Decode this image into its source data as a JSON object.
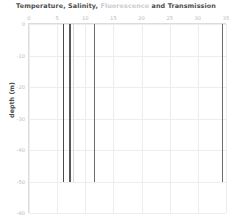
{
  "chart_data": {
    "type": "line",
    "title": "Temperature, Salinity, Fluorescence and Transmission",
    "title_parts": [
      {
        "text": "Temperature,",
        "color": "#4d4d4d"
      },
      {
        "text": "Salinity,",
        "color": "#4d4d4d"
      },
      {
        "text": "Fluorescence",
        "color": "#c9ccd1"
      },
      {
        "text": "and",
        "color": "#4d4d4d"
      },
      {
        "text": "Transmission",
        "color": "#4d4d4d"
      }
    ],
    "xlabel": "",
    "ylabel": "depth (m)",
    "xlim": [
      0,
      35
    ],
    "ylim": [
      -60,
      0
    ],
    "xticks": [
      0,
      5,
      10,
      15,
      20,
      25,
      30,
      35
    ],
    "xtick_labels": [
      "0",
      "5",
      "10",
      "15",
      "20",
      "25",
      "30",
      "35"
    ],
    "yticks": [
      0,
      -10,
      -20,
      -30,
      -40,
      -50,
      -60
    ],
    "ytick_labels": [
      "0",
      "-10",
      "-20",
      "-30",
      "-40",
      "-50",
      "-60"
    ],
    "x_axis_position": "top",
    "grid": true,
    "legend": "none",
    "series": [
      {
        "name": "Temperature",
        "color": "#4a4a4a",
        "x_mean": 6.1,
        "depth_start": 0,
        "depth_end": -50,
        "points": [
          {
            "depth": 0,
            "value": 6.2
          },
          {
            "depth": -10,
            "value": 6.1
          },
          {
            "depth": -20,
            "value": 6.1
          },
          {
            "depth": -30,
            "value": 6.0
          },
          {
            "depth": -40,
            "value": 6.0
          },
          {
            "depth": -50,
            "value": 6.0
          }
        ]
      },
      {
        "name": "Salinity",
        "color": "#5a5a5a",
        "x_mean": 7.3,
        "depth_start": 0,
        "depth_end": -50,
        "points": [
          {
            "depth": 0,
            "value": 7.3
          },
          {
            "depth": -10,
            "value": 7.3
          },
          {
            "depth": -20,
            "value": 7.3
          },
          {
            "depth": -30,
            "value": 7.3
          },
          {
            "depth": -40,
            "value": 7.3
          },
          {
            "depth": -50,
            "value": 7.3
          }
        ]
      },
      {
        "name": "Fluorescence",
        "color": "#d6d9dd",
        "x_mean": 7.9,
        "depth_start": 0,
        "depth_end": -50,
        "points": [
          {
            "depth": 0,
            "value": 7.9
          },
          {
            "depth": -10,
            "value": 7.9
          },
          {
            "depth": -20,
            "value": 7.9
          },
          {
            "depth": -30,
            "value": 7.9
          },
          {
            "depth": -40,
            "value": 7.9
          },
          {
            "depth": -50,
            "value": 7.9
          }
        ]
      },
      {
        "name": "Transmission-inner",
        "color": "#6b6b6b",
        "x_mean": 11.6,
        "depth_start": 0,
        "depth_end": -50,
        "points": [
          {
            "depth": 0,
            "value": 11.6
          },
          {
            "depth": -10,
            "value": 11.6
          },
          {
            "depth": -20,
            "value": 11.6
          },
          {
            "depth": -30,
            "value": 11.6
          },
          {
            "depth": -40,
            "value": 11.6
          },
          {
            "depth": -50,
            "value": 11.6
          }
        ]
      },
      {
        "name": "Transmission",
        "color": "#6e6e6e",
        "x_mean": 34.4,
        "depth_start": 0,
        "depth_end": -50,
        "points": [
          {
            "depth": 0,
            "value": 34.4
          },
          {
            "depth": -10,
            "value": 34.4
          },
          {
            "depth": -20,
            "value": 34.4
          },
          {
            "depth": -30,
            "value": 34.4
          },
          {
            "depth": -40,
            "value": 34.4
          },
          {
            "depth": -50,
            "value": 34.4
          }
        ]
      }
    ]
  },
  "colors": {
    "background": "#ffffff",
    "grid": "#ededed",
    "axis": "#dcdcdc",
    "tick_label": "#b9bcc0",
    "title_text": "#4d4d4d",
    "fluorescence_accent": "#c9ccd1"
  }
}
